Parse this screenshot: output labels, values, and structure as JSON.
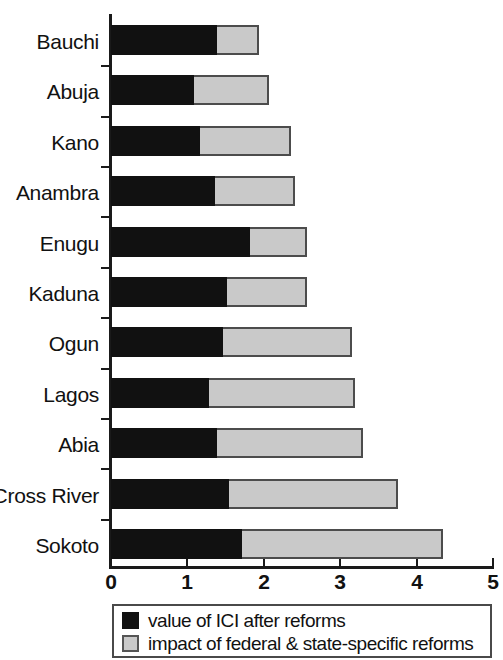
{
  "chart_data": {
    "type": "bar",
    "orientation": "horizontal",
    "stacked": true,
    "title": "",
    "xlabel": "",
    "ylabel": "",
    "xlim": [
      0,
      5
    ],
    "xticks": [
      "0",
      "1",
      "2",
      "3",
      "4",
      "5"
    ],
    "grid": false,
    "legend_position": "bottom",
    "categories": [
      "Bauchi",
      "Abuja",
      "Kano",
      "Anambra",
      "Enugu",
      "Kaduna",
      "Ogun",
      "Lagos",
      "Abia",
      "Cross River",
      "Sokoto"
    ],
    "series": [
      {
        "name": "value of ICI after reforms",
        "color": "#111111",
        "values": [
          1.39,
          1.09,
          1.16,
          1.36,
          1.82,
          1.52,
          1.46,
          1.28,
          1.39,
          1.55,
          1.71
        ]
      },
      {
        "name": "impact of federal & state-specific reforms",
        "color": "#c9c9c9",
        "values": [
          0.55,
          0.98,
          1.19,
          1.05,
          0.75,
          1.04,
          1.69,
          1.92,
          1.91,
          2.21,
          2.64
        ]
      }
    ],
    "totals": [
      1.94,
      2.07,
      2.35,
      2.41,
      2.57,
      2.56,
      3.15,
      3.2,
      3.3,
      3.76,
      4.35
    ]
  },
  "legend": {
    "items": [
      {
        "label": "value of ICI after reforms",
        "swatch": "black"
      },
      {
        "label": "impact of federal & state-specific reforms",
        "swatch": "gray"
      }
    ]
  }
}
